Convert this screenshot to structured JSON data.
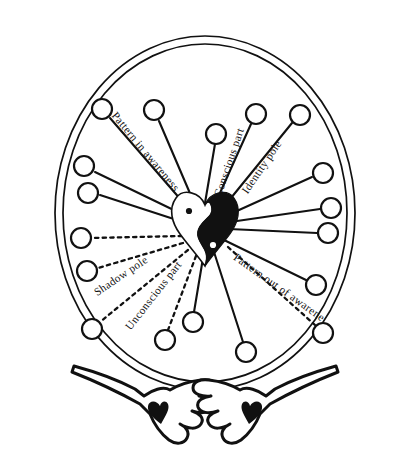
{
  "diagram": {
    "background_color": "#ffffff",
    "ink_color": "#111111",
    "labels": {
      "pattern_in_awareness": "Pattern in awareness",
      "conscious_part": "Conscious part",
      "identity_pole": "Identity pole",
      "shadow_pole": "Shadow pole",
      "unconscious_part": "Unconscious part",
      "pattern_out_of_awareness": "Pattern out of awareness"
    },
    "center": {
      "name": "heart-yin-yang",
      "light_half_color": "#ffffff",
      "dark_half_color": "#111111"
    },
    "ring": {
      "name": "outer-double-circle",
      "stroke_count": 2
    },
    "spokes": [
      {
        "id": "s1",
        "style": "solid",
        "angle_deg": 196,
        "label_ref": null
      },
      {
        "id": "s2",
        "style": "solid",
        "angle_deg": 214,
        "label_ref": null
      },
      {
        "id": "s3",
        "style": "solid",
        "angle_deg": 232,
        "label_ref": "pattern_in_awareness"
      },
      {
        "id": "s4",
        "style": "solid",
        "angle_deg": 252,
        "label_ref": null
      },
      {
        "id": "s5",
        "style": "solid",
        "angle_deg": 272,
        "label_ref": null
      },
      {
        "id": "s6",
        "style": "solid",
        "angle_deg": 290,
        "label_ref": "conscious_part"
      },
      {
        "id": "s7",
        "style": "solid",
        "angle_deg": 310,
        "label_ref": "identity_pole"
      },
      {
        "id": "s8",
        "style": "solid",
        "angle_deg": 330,
        "label_ref": null
      },
      {
        "id": "s9",
        "style": "solid",
        "angle_deg": 350,
        "label_ref": null
      },
      {
        "id": "s10",
        "style": "solid",
        "angle_deg": 8,
        "label_ref": null
      },
      {
        "id": "s11",
        "style": "dashed",
        "angle_deg": 26,
        "label_ref": "pattern_out_of_awareness"
      },
      {
        "id": "s12",
        "style": "solid",
        "angle_deg": 48,
        "label_ref": null
      },
      {
        "id": "s13",
        "style": "solid",
        "angle_deg": 74,
        "label_ref": null
      },
      {
        "id": "s14",
        "style": "dashed",
        "angle_deg": 104,
        "label_ref": "unconscious_part"
      },
      {
        "id": "s15",
        "style": "dashed",
        "angle_deg": 130,
        "label_ref": "shadow_pole"
      },
      {
        "id": "s16",
        "style": "dashed",
        "angle_deg": 158,
        "label_ref": null
      },
      {
        "id": "s17",
        "style": "dashed",
        "angle_deg": 176,
        "label_ref": null
      }
    ],
    "hands": {
      "name": "two-open-hands",
      "count": 2,
      "left_name": "left-hand",
      "right_name": "right-hand",
      "palm_symbol": "heart"
    }
  }
}
